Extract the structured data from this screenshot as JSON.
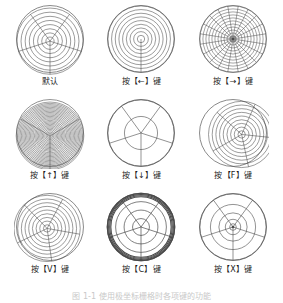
{
  "figure": {
    "caption": "图 1-1  使用极坐标栅格时各项键的功能",
    "caption_visible": "partially cut off at bottom edge",
    "stroke_color": "#4a4a4a",
    "background_color": "#ffffff"
  },
  "cells": [
    {
      "id": "default",
      "caption": "默认",
      "circles": 8,
      "spokes": 5,
      "spoke_offset_deg": 18,
      "center": [
        0.5,
        0.53
      ],
      "radius": 0.46,
      "stroke_width": 0.55,
      "heavy_rim": false,
      "center_dot": false
    },
    {
      "id": "left-arrow",
      "caption": "按【←】键",
      "circles": 9,
      "spokes": 1,
      "spoke_offset_deg": 90,
      "center": [
        0.5,
        0.5
      ],
      "radius": 0.46,
      "stroke_width": 0.55,
      "heavy_rim": false,
      "center_dot": false
    },
    {
      "id": "right-arrow",
      "caption": "按【→】键",
      "circles": 11,
      "spokes": 20,
      "spoke_offset_deg": 9,
      "center": [
        0.5,
        0.5
      ],
      "radius": 0.46,
      "stroke_width": 0.5,
      "heavy_rim": false,
      "center_dot": true
    },
    {
      "id": "up-arrow",
      "caption": "按【↑】键",
      "circles": 26,
      "spokes": 3,
      "spoke_offset_deg": 90,
      "center": [
        0.5,
        0.54
      ],
      "radius": 0.47,
      "stroke_width": 0.5,
      "heavy_rim": false,
      "center_dot": false
    },
    {
      "id": "down-arrow",
      "caption": "按【↓】键",
      "circles": 2,
      "spokes": 5,
      "spoke_offset_deg": 90,
      "center": [
        0.5,
        0.5
      ],
      "radius": 0.46,
      "stroke_width": 0.6,
      "heavy_rim": false,
      "center_dot": false
    },
    {
      "id": "key-f",
      "caption": "按【F】键",
      "circles": 9,
      "spokes": 5,
      "spoke_offset_deg": 78,
      "center": [
        0.62,
        0.52
      ],
      "radius": 0.46,
      "stroke_width": 0.55,
      "heavy_rim": false,
      "center_dot": false
    },
    {
      "id": "key-v",
      "caption": "按【V】键",
      "circles": 9,
      "spokes": 5,
      "spoke_offset_deg": 82,
      "center": [
        0.46,
        0.52
      ],
      "radius": 0.46,
      "stroke_width": 0.55,
      "heavy_rim": false,
      "center_dot": false
    },
    {
      "id": "key-c",
      "caption": "按【C】键",
      "circles": 4,
      "spokes": 5,
      "spoke_offset_deg": 90,
      "center": [
        0.5,
        0.5
      ],
      "radius": 0.47,
      "stroke_width": 0.7,
      "heavy_rim": true,
      "center_dot": false
    },
    {
      "id": "key-x",
      "caption": "按【X】键",
      "circles": 6,
      "spokes": 5,
      "spoke_offset_deg": 90,
      "center": [
        0.5,
        0.5
      ],
      "radius": 0.46,
      "stroke_width": 0.6,
      "center_dot": true,
      "compressed_inner": true
    }
  ]
}
